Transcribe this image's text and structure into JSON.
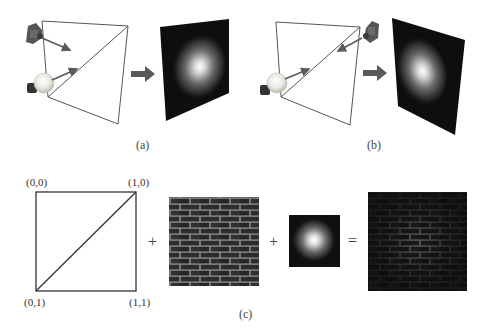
{
  "figure": {
    "panels": [
      {
        "id": "a",
        "label": "(a)",
        "description": "Camera and light bulb on same side projecting onto a quad; output shows a spotlight highlight on a dark panel"
      },
      {
        "id": "b",
        "label": "(b)",
        "description": "Camera on opposite side from light bulb; output shows spotlight highlight on a dark panel"
      },
      {
        "id": "c",
        "label": "(c)",
        "description": "Texture-coordinate square plus brick texture plus spotlight map equals lit brick texture"
      }
    ],
    "texture_coords": {
      "top_left": "(0,0)",
      "top_right": "(1,0)",
      "bottom_left": "(0,1)",
      "bottom_right": "(1,1)"
    },
    "operators": {
      "plus_1": "+",
      "plus_2": "+",
      "equals": "="
    },
    "colors": {
      "line": "#555555",
      "arrow": "#5a5a5a",
      "panel_dark": "#0e0e0e",
      "brick_dark": "#2a2a2a",
      "mortar": "#8a8a8a"
    }
  }
}
